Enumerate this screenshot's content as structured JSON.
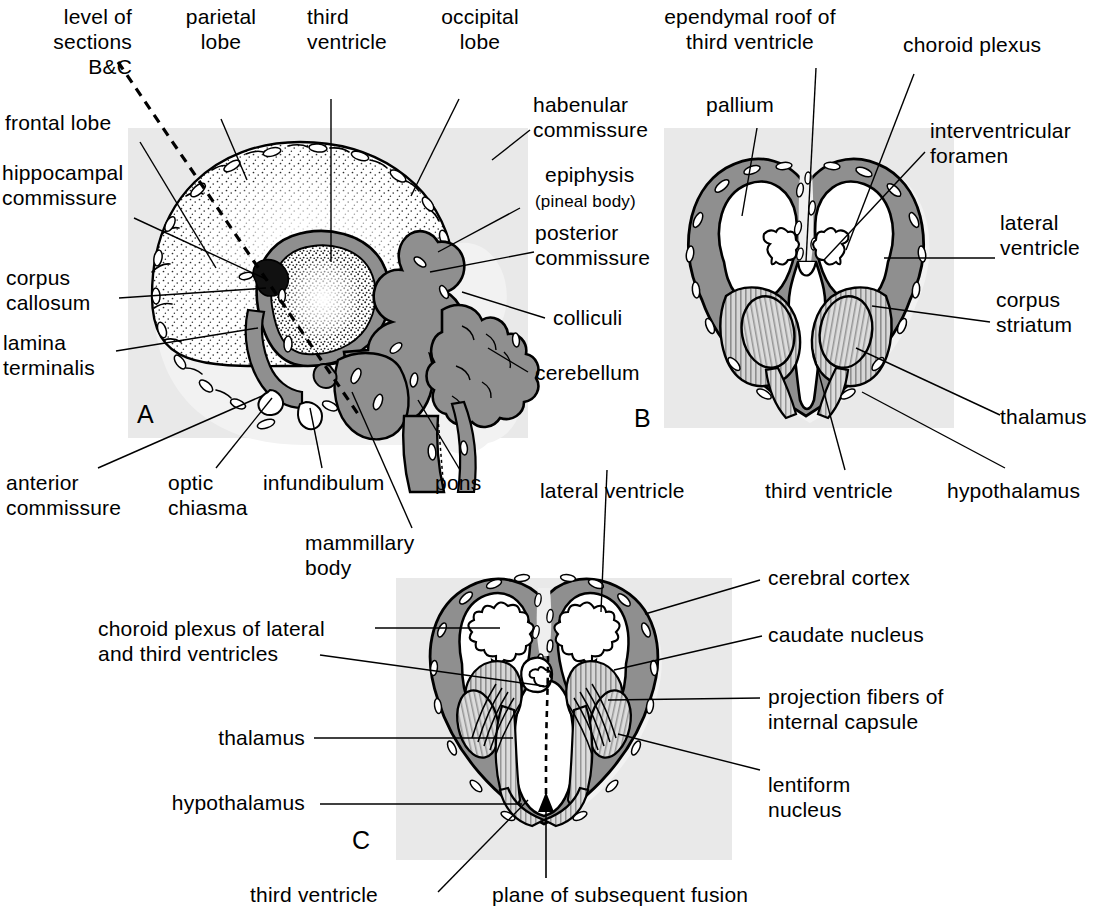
{
  "figure": {
    "panel_letters": [
      "A",
      "B",
      "C"
    ]
  },
  "colors": {
    "background_panel": "#e8e8e8",
    "mantle_dark": "#8a8a8a",
    "mantle_mid": "#b5b5b5",
    "hatch_light": "#cfcfcf",
    "ventricle_white": "#ffffff",
    "outline": "#000000",
    "halo": "#f0f0f0"
  },
  "panel_a": {
    "letter": "A",
    "labels": [
      {
        "id": "level-of-sections",
        "text": "level of\nsections\nB&C",
        "align": "right"
      },
      {
        "id": "parietal-lobe",
        "text": "parietal\nlobe",
        "align": "center"
      },
      {
        "id": "third-ventricle",
        "text": "third\nventricle",
        "align": "left"
      },
      {
        "id": "occipital-lobe",
        "text": "occipital\nlobe",
        "align": "center"
      },
      {
        "id": "frontal-lobe",
        "text": "frontal lobe",
        "align": "left"
      },
      {
        "id": "hippocampal-commissure",
        "text": "hippocampal\ncommissure",
        "align": "left"
      },
      {
        "id": "corpus-callosum",
        "text": "corpus\ncallosum",
        "align": "left"
      },
      {
        "id": "lamina-terminalis",
        "text": "lamina\nterminalis",
        "align": "left"
      },
      {
        "id": "habenular-commissure",
        "text": "habenular\ncommissure",
        "align": "left"
      },
      {
        "id": "epiphysis",
        "text": "epiphysis",
        "align": "left"
      },
      {
        "id": "pineal-body",
        "text": "(pineal body)",
        "align": "left"
      },
      {
        "id": "posterior-commissure",
        "text": "posterior\ncommissure",
        "align": "left"
      },
      {
        "id": "colliculi",
        "text": "colliculi",
        "align": "left"
      },
      {
        "id": "cerebellum",
        "text": "cerebellum",
        "align": "left"
      },
      {
        "id": "anterior-commissure",
        "text": "anterior\ncommissure",
        "align": "left"
      },
      {
        "id": "optic-chiasma",
        "text": "optic\nchiasma",
        "align": "left"
      },
      {
        "id": "infundibulum",
        "text": "infundibulum",
        "align": "left"
      },
      {
        "id": "pons",
        "text": "pons",
        "align": "left"
      },
      {
        "id": "mammillary-body",
        "text": "mammillary\nbody",
        "align": "left"
      }
    ]
  },
  "panel_b": {
    "letter": "B",
    "labels": [
      {
        "id": "ependymal-roof",
        "text": "ependymal roof of\nthird ventricle",
        "align": "center"
      },
      {
        "id": "choroid-plexus",
        "text": "choroid plexus",
        "align": "left"
      },
      {
        "id": "pallium",
        "text": "pallium",
        "align": "left"
      },
      {
        "id": "interventricular-foramen",
        "text": "interventricular\nforamen",
        "align": "left"
      },
      {
        "id": "lateral-ventricle",
        "text": "lateral\nventricle",
        "align": "left"
      },
      {
        "id": "corpus-striatum",
        "text": "corpus\nstriatum",
        "align": "left"
      },
      {
        "id": "thalamus",
        "text": "thalamus",
        "align": "left"
      },
      {
        "id": "third-ventricle",
        "text": "third ventricle",
        "align": "left"
      },
      {
        "id": "hypothalamus",
        "text": "hypothalamus",
        "align": "left"
      }
    ]
  },
  "panel_c": {
    "letter": "C",
    "labels": [
      {
        "id": "lateral-ventricle",
        "text": "lateral ventricle",
        "align": "left"
      },
      {
        "id": "cerebral-cortex",
        "text": "cerebral cortex",
        "align": "left"
      },
      {
        "id": "choroid-plexus-lat-third",
        "text": "choroid plexus of lateral\nand third ventricles",
        "align": "left"
      },
      {
        "id": "caudate-nucleus",
        "text": "caudate nucleus",
        "align": "left"
      },
      {
        "id": "projection-fibers",
        "text": "projection fibers of\ninternal capsule",
        "align": "left"
      },
      {
        "id": "thalamus",
        "text": "thalamus",
        "align": "right"
      },
      {
        "id": "lentiform-nucleus",
        "text": "lentiform\nnucleus",
        "align": "left"
      },
      {
        "id": "hypothalamus",
        "text": "hypothalamus",
        "align": "right"
      },
      {
        "id": "third-ventricle",
        "text": "third ventricle",
        "align": "left"
      },
      {
        "id": "plane-of-fusion",
        "text": "plane of subsequent fusion",
        "align": "left"
      }
    ]
  },
  "labels_flat": {
    "a_level_of_sections": "level of\nsections\nB&C",
    "a_parietal_lobe": "parietal\nlobe",
    "a_third_ventricle": "third\nventricle",
    "a_occipital_lobe": "occipital\nlobe",
    "a_frontal_lobe": "frontal lobe",
    "a_hippocampal_commissure": "hippocampal\ncommissure",
    "a_corpus_callosum": "corpus\ncallosum",
    "a_lamina_terminalis": "lamina\nterminalis",
    "a_habenular_commissure": "habenular\ncommissure",
    "a_epiphysis": "epiphysis",
    "a_pineal_body": "(pineal body)",
    "a_posterior_commissure": "posterior\ncommissure",
    "a_colliculi": "colliculi",
    "a_cerebellum": "cerebellum",
    "a_anterior_commissure": "anterior\ncommissure",
    "a_optic_chiasma": "optic\nchiasma",
    "a_infundibulum": "infundibulum",
    "a_pons": "pons",
    "a_mammillary_body": "mammillary\nbody",
    "a_letter": "A",
    "b_ependymal_roof": "ependymal roof of\nthird ventricle",
    "b_choroid_plexus": "choroid plexus",
    "b_pallium": "pallium",
    "b_interventricular_foramen": "interventricular\nforamen",
    "b_lateral_ventricle": "lateral\nventricle",
    "b_corpus_striatum": "corpus\nstriatum",
    "b_thalamus": "thalamus",
    "b_third_ventricle": "third ventricle",
    "b_hypothalamus": "hypothalamus",
    "b_letter": "B",
    "c_lateral_ventricle": "lateral ventricle",
    "c_cerebral_cortex": "cerebral cortex",
    "c_choroid_plexus": "choroid plexus of lateral\nand third ventricles",
    "c_caudate_nucleus": "caudate nucleus",
    "c_projection_fibers": "projection fibers of\ninternal capsule",
    "c_thalamus": "thalamus",
    "c_lentiform_nucleus": "lentiform\nnucleus",
    "c_hypothalamus": "hypothalamus",
    "c_third_ventricle": "third ventricle",
    "c_plane_of_fusion": "plane of subsequent fusion",
    "c_letter": "C"
  }
}
